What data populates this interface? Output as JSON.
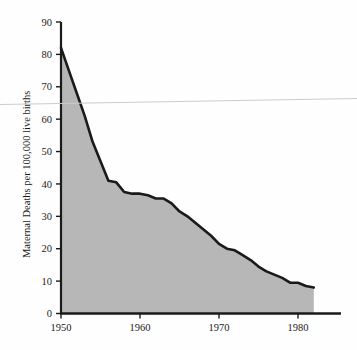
{
  "chart_data": {
    "type": "area",
    "title": "",
    "subtitle": "",
    "xlabel": "",
    "ylabel": "Maternal Deaths per 100,000 live births",
    "xlim": [
      1950,
      1986
    ],
    "ylim": [
      0,
      90
    ],
    "xticks": [
      1950,
      1960,
      1970,
      1980
    ],
    "xtick_labels": [
      "1950",
      "1960",
      "1970",
      "1980"
    ],
    "yticks": [
      0,
      10,
      20,
      30,
      40,
      50,
      60,
      70,
      80,
      90
    ],
    "ytick_labels": [
      "0",
      "10",
      "20",
      "30",
      "40",
      "50",
      "60",
      "70",
      "80",
      "90"
    ],
    "grid": false,
    "legend": null,
    "legend_position": "none",
    "annotations": [],
    "series": [
      {
        "name": "Maternal mortality rate",
        "line_color": "#1a1a1a",
        "fill_color": "#b7b7b7",
        "x": [
          1950,
          1951,
          1952,
          1953,
          1954,
          1955,
          1956,
          1957,
          1958,
          1959,
          1960,
          1961,
          1962,
          1963,
          1964,
          1965,
          1966,
          1967,
          1968,
          1969,
          1970,
          1971,
          1972,
          1973,
          1974,
          1975,
          1976,
          1977,
          1978,
          1979,
          1980,
          1981,
          1982
        ],
        "values": [
          82,
          75,
          68,
          61,
          53,
          47,
          41,
          40.5,
          37.5,
          37,
          37,
          36.5,
          35.5,
          35.5,
          34,
          31.5,
          30,
          28,
          26,
          24,
          21.5,
          20,
          19.5,
          18,
          16.5,
          14.5,
          13,
          12,
          11,
          9.5,
          9.5,
          8.5,
          8
        ]
      }
    ]
  },
  "axes": {
    "y_axis_label": "Maternal Deaths per 100,000 live births"
  },
  "colors": {
    "fill": "#b7b7b7",
    "line": "#1a1a1a",
    "axis": "#1a1a1a",
    "background": "#fefefe",
    "artifact_line": "#c9c9c9"
  }
}
